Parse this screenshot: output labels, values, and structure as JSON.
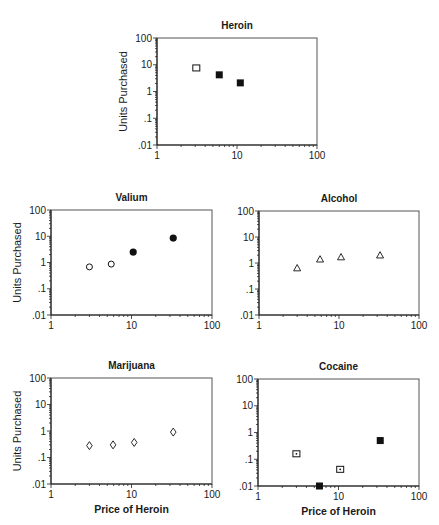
{
  "chart_data": [
    {
      "type": "scatter",
      "title": "Heroin",
      "xlabel": "",
      "ylabel": "Units Purchased",
      "xscale": "log",
      "yscale": "log",
      "xlim": [
        1,
        100
      ],
      "ylim": [
        0.01,
        100
      ],
      "xticks": [
        "1",
        "10",
        "100"
      ],
      "yticks": [
        ".01",
        ".1",
        "1",
        "10",
        "100"
      ],
      "grid": false,
      "points": [
        {
          "x": 3.1,
          "y": 7.6,
          "marker": "square-open"
        },
        {
          "x": 6.0,
          "y": 4.2,
          "marker": "square-filled"
        },
        {
          "x": 11,
          "y": 2.1,
          "marker": "square-filled"
        }
      ]
    },
    {
      "type": "scatter",
      "title": "Valium",
      "xlabel": "",
      "ylabel": "Units Purchased",
      "xscale": "log",
      "yscale": "log",
      "xlim": [
        1,
        100
      ],
      "ylim": [
        0.01,
        100
      ],
      "xticks": [
        "1",
        "10",
        "100"
      ],
      "yticks": [
        ".01",
        ".1",
        "1",
        "10",
        "100"
      ],
      "grid": false,
      "points": [
        {
          "x": 3.0,
          "y": 0.68,
          "marker": "circle-open"
        },
        {
          "x": 5.6,
          "y": 0.87,
          "marker": "circle-open"
        },
        {
          "x": 10.5,
          "y": 2.5,
          "marker": "circle-filled"
        },
        {
          "x": 33,
          "y": 8.5,
          "marker": "circle-filled"
        }
      ]
    },
    {
      "type": "scatter",
      "title": "Alcohol",
      "xlabel": "",
      "ylabel": "",
      "xscale": "log",
      "yscale": "log",
      "xlim": [
        1,
        100
      ],
      "ylim": [
        0.01,
        100
      ],
      "xticks": [
        "1",
        "10",
        "100"
      ],
      "yticks": [
        ".01",
        ".1",
        "1",
        "10",
        "100"
      ],
      "grid": false,
      "points": [
        {
          "x": 3.0,
          "y": 0.64,
          "marker": "triangle-open"
        },
        {
          "x": 5.8,
          "y": 1.4,
          "marker": "triangle-open"
        },
        {
          "x": 10.6,
          "y": 1.7,
          "marker": "triangle-open"
        },
        {
          "x": 32.6,
          "y": 2.0,
          "marker": "triangle-open"
        }
      ]
    },
    {
      "type": "scatter",
      "title": "Marijuana",
      "xlabel": "Price of Heroin",
      "ylabel": "Units Purchased",
      "xscale": "log",
      "yscale": "log",
      "xlim": [
        1,
        100
      ],
      "ylim": [
        0.01,
        100
      ],
      "xticks": [
        "1",
        "10",
        "100"
      ],
      "yticks": [
        ".01",
        ".1",
        "1",
        "10",
        "100"
      ],
      "grid": false,
      "points": [
        {
          "x": 3.0,
          "y": 0.28,
          "marker": "diamond-open"
        },
        {
          "x": 5.9,
          "y": 0.3,
          "marker": "diamond-open"
        },
        {
          "x": 10.8,
          "y": 0.37,
          "marker": "diamond-open"
        },
        {
          "x": 33,
          "y": 0.91,
          "marker": "diamond-open"
        }
      ]
    },
    {
      "type": "scatter",
      "title": "Cocaine",
      "xlabel": "Price of Heroin",
      "ylabel": "",
      "xscale": "log",
      "yscale": "log",
      "xlim": [
        1,
        100
      ],
      "ylim": [
        0.01,
        100
      ],
      "xticks": [
        "1",
        "10",
        "100"
      ],
      "yticks": [
        ".01",
        ".1",
        "1",
        "10",
        "100"
      ],
      "grid": false,
      "points": [
        {
          "x": 3.0,
          "y": 0.16,
          "marker": "square-dot"
        },
        {
          "x": 5.8,
          "y": 0.01,
          "marker": "square-filled"
        },
        {
          "x": 10.5,
          "y": 0.042,
          "marker": "square-dot"
        },
        {
          "x": 33,
          "y": 0.5,
          "marker": "square-filled"
        }
      ]
    }
  ]
}
